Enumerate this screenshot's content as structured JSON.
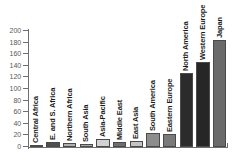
{
  "chart_data": {
    "type": "bar",
    "title": "",
    "xlabel": "",
    "ylabel": "",
    "ylim": [
      0,
      200
    ],
    "grid": false,
    "legend": "none",
    "y_ticks": [
      200,
      180,
      160,
      140,
      120,
      100,
      80,
      60,
      40,
      20,
      0
    ],
    "categories": [
      "Central Africa",
      "E. and S. Africa",
      "Northern Africa",
      "South Asia",
      "Asia-Pacific",
      "Middle East",
      "East Asia",
      "South America",
      "Eastern Europe",
      "North America",
      "Western Europe",
      "Japan"
    ],
    "values": [
      3,
      8,
      7,
      5,
      14,
      9,
      11,
      25,
      22,
      128,
      146,
      185
    ],
    "bar_colors": [
      "#585858",
      "#4f4f4f",
      "#b0b0b0",
      "#a8a8a8",
      "#d2d2d2",
      "#6f6f6f",
      "#c4c4c4",
      "#8d8d8d",
      "#7a7a7a",
      "#2b2b2b",
      "#262626",
      "#6a6a6a"
    ]
  }
}
